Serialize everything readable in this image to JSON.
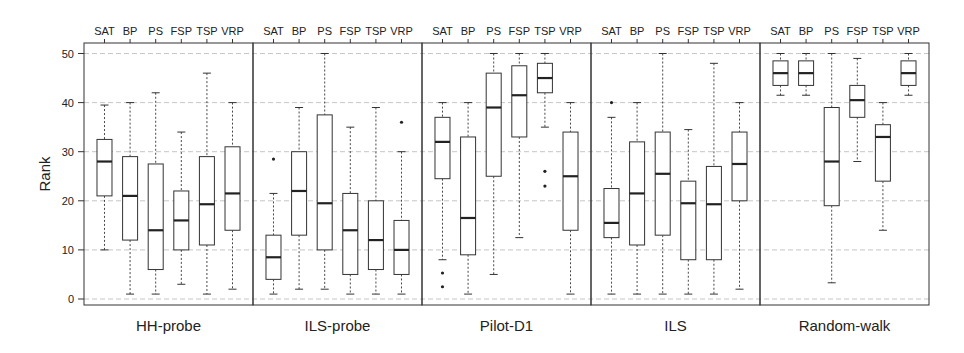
{
  "chart_data": {
    "type": "boxplot",
    "title": "",
    "ylabel": "Rank",
    "ylim": [
      0,
      50
    ],
    "yticks": [
      0,
      10,
      20,
      30,
      40,
      50
    ],
    "grid": true,
    "categories": [
      "SAT",
      "BP",
      "PS",
      "FSP",
      "TSP",
      "VRP"
    ],
    "panels": [
      {
        "name": "HH-probe",
        "boxes": [
          {
            "cat": "SAT",
            "lo": 10,
            "q1": 21,
            "med": 28,
            "q3": 32.5,
            "hi": 39.5,
            "outliers": []
          },
          {
            "cat": "BP",
            "lo": 1,
            "q1": 12,
            "med": 21,
            "q3": 29,
            "hi": 40,
            "outliers": []
          },
          {
            "cat": "PS",
            "lo": 1,
            "q1": 6,
            "med": 14,
            "q3": 27.5,
            "hi": 42,
            "outliers": []
          },
          {
            "cat": "FSP",
            "lo": 3,
            "q1": 10,
            "med": 16,
            "q3": 22,
            "hi": 34,
            "outliers": []
          },
          {
            "cat": "TSP",
            "lo": 1,
            "q1": 11,
            "med": 19.3,
            "q3": 29,
            "hi": 46,
            "outliers": []
          },
          {
            "cat": "VRP",
            "lo": 2,
            "q1": 14,
            "med": 21.5,
            "q3": 31,
            "hi": 40,
            "outliers": []
          }
        ]
      },
      {
        "name": "ILS-probe",
        "boxes": [
          {
            "cat": "SAT",
            "lo": 1,
            "q1": 4,
            "med": 8.5,
            "q3": 13,
            "hi": 21.5,
            "outliers": [
              28.5
            ]
          },
          {
            "cat": "BP",
            "lo": 2,
            "q1": 13,
            "med": 22,
            "q3": 30,
            "hi": 39,
            "outliers": []
          },
          {
            "cat": "PS",
            "lo": 2,
            "q1": 10,
            "med": 19.5,
            "q3": 37.5,
            "hi": 50,
            "outliers": []
          },
          {
            "cat": "FSP",
            "lo": 1,
            "q1": 5,
            "med": 14,
            "q3": 21.5,
            "hi": 35,
            "outliers": []
          },
          {
            "cat": "TSP",
            "lo": 1,
            "q1": 6,
            "med": 12,
            "q3": 20,
            "hi": 39,
            "outliers": []
          },
          {
            "cat": "VRP",
            "lo": 1,
            "q1": 5,
            "med": 10,
            "q3": 16,
            "hi": 30,
            "outliers": [
              36
            ]
          }
        ]
      },
      {
        "name": "Pilot-D1",
        "boxes": [
          {
            "cat": "SAT",
            "lo": 8,
            "q1": 24.5,
            "med": 32,
            "q3": 37,
            "hi": 40,
            "outliers": [
              5.3,
              2.5
            ]
          },
          {
            "cat": "BP",
            "lo": 1,
            "q1": 9,
            "med": 16.5,
            "q3": 33,
            "hi": 40,
            "outliers": []
          },
          {
            "cat": "PS",
            "lo": 5,
            "q1": 25,
            "med": 39,
            "q3": 46,
            "hi": 50,
            "outliers": []
          },
          {
            "cat": "FSP",
            "lo": 12.5,
            "q1": 33,
            "med": 41.5,
            "q3": 47.5,
            "hi": 50,
            "outliers": []
          },
          {
            "cat": "TSP",
            "lo": 35,
            "q1": 42,
            "med": 45,
            "q3": 48,
            "hi": 50,
            "outliers": [
              26,
              23
            ]
          },
          {
            "cat": "VRP",
            "lo": 1,
            "q1": 14,
            "med": 25,
            "q3": 34,
            "hi": 40,
            "outliers": []
          }
        ]
      },
      {
        "name": "ILS",
        "boxes": [
          {
            "cat": "SAT",
            "lo": 1,
            "q1": 12.5,
            "med": 15.5,
            "q3": 22.5,
            "hi": 37,
            "outliers": [
              40
            ]
          },
          {
            "cat": "BP",
            "lo": 1,
            "q1": 11,
            "med": 21.5,
            "q3": 32,
            "hi": 40,
            "outliers": []
          },
          {
            "cat": "PS",
            "lo": 1,
            "q1": 13,
            "med": 25.5,
            "q3": 34,
            "hi": 50,
            "outliers": []
          },
          {
            "cat": "FSP",
            "lo": 1,
            "q1": 8,
            "med": 19.5,
            "q3": 24,
            "hi": 34.5,
            "outliers": []
          },
          {
            "cat": "TSP",
            "lo": 1,
            "q1": 8,
            "med": 19.3,
            "q3": 27,
            "hi": 48,
            "outliers": []
          },
          {
            "cat": "VRP",
            "lo": 2,
            "q1": 20,
            "med": 27.5,
            "q3": 34,
            "hi": 40,
            "outliers": []
          }
        ]
      },
      {
        "name": "Random-walk",
        "boxes": [
          {
            "cat": "SAT",
            "lo": 41.5,
            "q1": 43.5,
            "med": 46,
            "q3": 48.5,
            "hi": 50,
            "outliers": []
          },
          {
            "cat": "BP",
            "lo": 41.5,
            "q1": 43.5,
            "med": 46,
            "q3": 48.5,
            "hi": 50,
            "outliers": []
          },
          {
            "cat": "PS",
            "lo": 3.3,
            "q1": 19,
            "med": 28,
            "q3": 39,
            "hi": 50,
            "outliers": []
          },
          {
            "cat": "FSP",
            "lo": 28,
            "q1": 37,
            "med": 40.5,
            "q3": 43.5,
            "hi": 49,
            "outliers": []
          },
          {
            "cat": "TSP",
            "lo": 14,
            "q1": 24,
            "med": 33,
            "q3": 35.5,
            "hi": 40,
            "outliers": []
          },
          {
            "cat": "VRP",
            "lo": 41.5,
            "q1": 43.5,
            "med": 46,
            "q3": 48.5,
            "hi": 50,
            "outliers": []
          }
        ]
      }
    ]
  },
  "colors": {
    "stroke": "#333333",
    "grid": "#b8b8b8",
    "median": "#222222",
    "background": "#ffffff"
  }
}
